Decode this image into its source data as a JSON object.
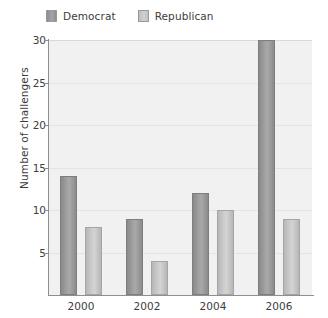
{
  "chart_data": {
    "type": "bar",
    "title": "",
    "categories": [
      "2000",
      "2002",
      "2004",
      "2006"
    ],
    "series": [
      {
        "name": "Democrat",
        "values": [
          14,
          9,
          12,
          30
        ],
        "color": "#9a9a9a"
      },
      {
        "name": "Republican",
        "values": [
          8,
          4,
          10,
          9
        ],
        "color": "#c8c8c8"
      }
    ],
    "xlabel": "",
    "ylabel": "Number of challengers",
    "ylim": [
      0,
      30
    ],
    "yticks": [
      5,
      10,
      15,
      20,
      25,
      30
    ],
    "ytick_labels": [
      "5",
      "10",
      "15",
      "20",
      "25",
      "30"
    ],
    "grid": true,
    "legend_position": "top-left",
    "plot_background": "#f1f1f1",
    "axis_color": "#8f8f8f"
  },
  "legend": {
    "entries": [
      {
        "label": "Democrat",
        "swatch": "democrat-swatch"
      },
      {
        "label": "Republican",
        "swatch": "republican-swatch"
      }
    ]
  }
}
